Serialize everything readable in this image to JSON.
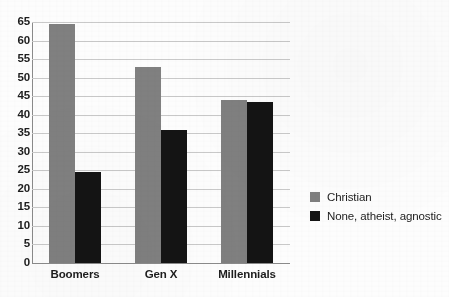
{
  "chart_data": {
    "type": "bar",
    "title": "",
    "subtitle": "",
    "xlabel": "",
    "ylabel": "",
    "categories": [
      "Boomers",
      "Gen X",
      "Millennials"
    ],
    "series": [
      {
        "name": "Christian",
        "color": "#808080",
        "values": [
          64.5,
          52.8,
          44.0
        ]
      },
      {
        "name": "None, atheist, agnostic",
        "color": "#141414",
        "values": [
          24.5,
          36.0,
          43.5
        ]
      }
    ],
    "ylim": [
      0,
      65
    ],
    "ytick_step": 5,
    "ytick_labels": [
      "0",
      "5",
      "10",
      "15",
      "20",
      "25",
      "30",
      "35",
      "40",
      "45",
      "50",
      "55",
      "60",
      "65"
    ],
    "grid": true,
    "grid_axis": "y",
    "legend_position": "right",
    "annotations": []
  },
  "colors": {
    "background": "#fdfdfd",
    "gridline": "#c9c9c9",
    "axis": "#8a8a8a",
    "text": "#1d1d1d",
    "series_christian": "#808080",
    "series_none": "#141414"
  }
}
